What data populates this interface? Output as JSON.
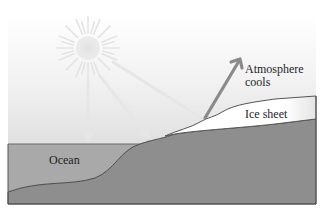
{
  "diagram": {
    "type": "ice-albedo-feedback illustration",
    "labels": {
      "atmosphere": "Atmosphere\ncools",
      "ice_sheet": "Ice sheet",
      "ocean": "Ocean"
    },
    "icons": {
      "sun": "sun-icon",
      "incoming_rays": "arrow-down-icon",
      "reflected_ray": "arrow-up-right-icon"
    },
    "colors": {
      "sky_top": "#ffffff",
      "sky_bottom": "#d2d2d2",
      "ocean": "#a9a9a9",
      "land": "#8e8e8e",
      "ice": "#ffffff",
      "outline": "#555555",
      "incoming_arrow": "#e6e6e6",
      "reflected_arrow": "#8a8a8a",
      "text": "#1e1e1e"
    }
  }
}
